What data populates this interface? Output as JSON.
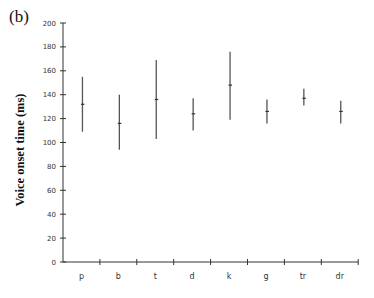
{
  "panel_label": "(b)",
  "chart_data": {
    "type": "range",
    "title": "",
    "xlabel": "",
    "ylabel": "Voice onset time (ms)",
    "ylim": [
      0,
      200
    ],
    "yticks": [
      0,
      20,
      40,
      60,
      80,
      100,
      120,
      140,
      160,
      180,
      200
    ],
    "grid": false,
    "legend": null,
    "categories": [
      "p",
      "b",
      "t",
      "d",
      "k",
      "g",
      "tr",
      "dr"
    ],
    "series": [
      {
        "name": "mean",
        "values": [
          132,
          116,
          136,
          124,
          148,
          126,
          137,
          126
        ]
      },
      {
        "name": "upper",
        "values": [
          155,
          140,
          169,
          137,
          176,
          136,
          145,
          135
        ]
      },
      {
        "name": "lower",
        "values": [
          109,
          94,
          103,
          110,
          119,
          116,
          131,
          116
        ]
      }
    ]
  }
}
